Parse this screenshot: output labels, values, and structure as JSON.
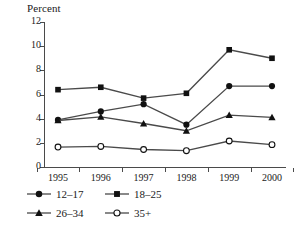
{
  "chart_data": {
    "type": "line",
    "title": "",
    "ylabel": "Percent",
    "xlabel": "",
    "categories": [
      "1995",
      "1996",
      "1997",
      "1998",
      "1999",
      "2000"
    ],
    "ylim": [
      0,
      12
    ],
    "yticks": [
      "0",
      "2",
      "4",
      "6",
      "8",
      "10",
      "12"
    ],
    "ytick_values": [
      0,
      2,
      4,
      6,
      8,
      10,
      12
    ],
    "grid": false,
    "legend_position": "below-left",
    "series": [
      {
        "name": "12–17",
        "marker": "filled-circle",
        "values": [
          3.9,
          4.6,
          5.2,
          3.5,
          6.7,
          6.7
        ]
      },
      {
        "name": "18–25",
        "marker": "filled-square",
        "values": [
          6.4,
          6.6,
          5.7,
          6.1,
          9.7,
          9.0
        ]
      },
      {
        "name": "26–34",
        "marker": "filled-triangle",
        "values": [
          3.85,
          4.15,
          3.6,
          3.0,
          4.3,
          4.1
        ]
      },
      {
        "name": "35+",
        "marker": "open-circle",
        "values": [
          1.65,
          1.7,
          1.45,
          1.35,
          2.15,
          1.85
        ]
      }
    ]
  },
  "axes": {
    "y_title": "Percent"
  },
  "legend": {
    "entries": [
      {
        "label": "12–17",
        "marker": "filled-circle-icon"
      },
      {
        "label": "26–34",
        "marker": "filled-triangle-icon"
      },
      {
        "label": "18–25",
        "marker": "filled-square-icon"
      },
      {
        "label": "35+",
        "marker": "open-circle-icon"
      }
    ]
  },
  "colors": {
    "line": "#4a4a4a",
    "marker_fill": "#111111",
    "marker_open_fill": "#ffffff",
    "axis": "#4a4a4a",
    "text": "#1a1a1a",
    "background": "#ffffff"
  }
}
